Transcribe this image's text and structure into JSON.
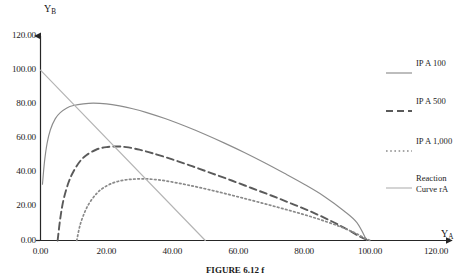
{
  "figure": {
    "caption": "FIGURE 6.12 f",
    "y_axis_title": "Y",
    "y_axis_subscript": "B",
    "x_axis_title": "Y",
    "x_axis_subscript": "A"
  },
  "legend": {
    "position": "right",
    "entries": [
      {
        "label": "IP A 100",
        "style": "solid",
        "color": "#8c8c8c"
      },
      {
        "label": "IP A 500",
        "style": "dashed",
        "color": "#5a5a5a"
      },
      {
        "label": "IP A 1,000",
        "style": "dotted",
        "color": "#8a8a8a"
      },
      {
        "label": "Reaction\nCurve rA",
        "style": "solid",
        "color": "#b4b4b4"
      }
    ]
  },
  "chart_data": {
    "type": "line",
    "title": "",
    "xlabel": "YA",
    "ylabel": "YB",
    "xlim": [
      0,
      120
    ],
    "ylim": [
      0,
      120
    ],
    "xticks": [
      "0.00",
      "20.00",
      "40.00",
      "60.00",
      "80.00",
      "100.00",
      "120.00"
    ],
    "yticks": [
      "0.00",
      "20.00",
      "40.00",
      "60.00",
      "80.00",
      "100.00",
      "120.00"
    ],
    "xtick_values": [
      0,
      20,
      40,
      60,
      80,
      100,
      120
    ],
    "ytick_values": [
      0,
      20,
      40,
      60,
      80,
      100,
      120
    ],
    "grid": false,
    "legend_position": "right",
    "series": [
      {
        "name": "IP A 100",
        "style": "solid",
        "color": "#8c8c8c",
        "x": [
          0.6,
          1.2,
          2,
          3,
          4.5,
          6,
          8,
          10,
          13,
          16,
          20,
          24,
          28,
          32,
          38,
          44,
          50,
          56,
          62,
          68,
          74,
          80,
          86,
          92,
          96,
          99
        ],
        "y": [
          33,
          46,
          57,
          65,
          71.5,
          75,
          77.8,
          79.2,
          80.2,
          80.6,
          80.2,
          79,
          77.3,
          75.2,
          71.4,
          67,
          62.2,
          57,
          51.5,
          45.6,
          39.4,
          33,
          26,
          17.5,
          10.5,
          0
        ]
      },
      {
        "name": "IP A 500",
        "style": "dashed",
        "color": "#5a5a5a",
        "x": [
          5.2,
          6,
          7,
          8.5,
          10,
          12,
          14,
          17,
          20,
          23,
          26,
          30,
          34,
          40,
          46,
          52,
          58,
          64,
          70,
          76,
          82,
          88,
          93,
          97,
          99.5
        ],
        "y": [
          0,
          13,
          24,
          34,
          40.5,
          46.5,
          50.2,
          53.4,
          54.8,
          55.2,
          54.8,
          53.3,
          51.2,
          47.6,
          43.6,
          39.4,
          35.2,
          30.8,
          26.4,
          21.8,
          17,
          11.6,
          6.6,
          2.2,
          0
        ]
      },
      {
        "name": "IP A 1,000",
        "style": "dotted",
        "color": "#8a8a8a",
        "x": [
          11,
          12,
          13.5,
          15,
          17,
          19,
          22,
          25,
          28,
          31,
          34,
          38,
          43,
          48,
          54,
          60,
          66,
          72,
          78,
          84,
          90,
          95,
          98,
          100
        ],
        "y": [
          0,
          9,
          17,
          22.5,
          27.5,
          30.8,
          33.8,
          35.3,
          36,
          36.2,
          35.9,
          35,
          33.2,
          31.2,
          28.5,
          25.6,
          22.6,
          19.5,
          16.3,
          12.8,
          8.8,
          4.8,
          1.8,
          0
        ]
      },
      {
        "name": "Reaction Curve rA",
        "style": "solid",
        "color": "#b4b4b4",
        "x": [
          0,
          50
        ],
        "y": [
          100,
          0
        ]
      }
    ],
    "annotations": {
      "reaction_curve_intercepts": {
        "y_intercept": 100,
        "x_intercept": 50
      },
      "peaks": [
        {
          "series": "IP A 100",
          "x": 17,
          "y": 80.6
        },
        {
          "series": "IP A 500",
          "x": 23,
          "y": 55.2
        },
        {
          "series": "IP A 1,000",
          "x": 31,
          "y": 36.2
        }
      ]
    }
  }
}
